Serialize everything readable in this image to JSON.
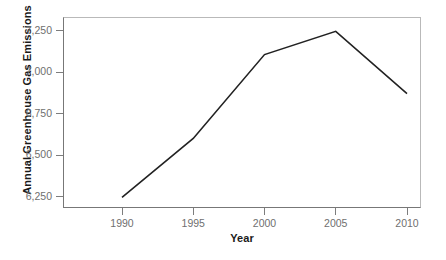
{
  "chart_data": {
    "type": "line",
    "title": "",
    "xlabel": "Year",
    "ylabel": "Annual Greenhouse Gas Emissions",
    "x": [
      1990,
      1995,
      2000,
      2005,
      2010
    ],
    "values": [
      6245,
      6600,
      7105,
      7245,
      6870
    ],
    "series": [
      {
        "name": "Annual Greenhouse Gas Emissions",
        "values": [
          6245,
          6600,
          7105,
          7245,
          6870
        ],
        "color": "#222222"
      }
    ],
    "x_tick_labels": [
      "1990",
      "1995",
      "2000",
      "2005",
      "2010"
    ],
    "y_tick_labels": [
      "6,250",
      "6,500",
      "6,750",
      "7,000",
      "7,250"
    ],
    "y_tick_values": [
      6250,
      6500,
      6750,
      7000,
      7250
    ],
    "xlim": [
      1986.5,
      1011.5
    ],
    "ylim": [
      6120,
      7345
    ],
    "grid": false,
    "legend": false,
    "legend_position": "none",
    "line_color": "#222222",
    "axis_color": "#777777",
    "tick_label_color": "#6f6f6f",
    "background_color": "#ffffff"
  },
  "axes": {
    "y_title": "Annual Greenhouse Gas Emissions",
    "x_title": "Year",
    "y_ticks": [
      {
        "label": "7,250",
        "value": 7250
      },
      {
        "label": "7,000",
        "value": 7000
      },
      {
        "label": "6,750",
        "value": 6750
      },
      {
        "label": "6,500",
        "value": 6500
      },
      {
        "label": "6,250",
        "value": 6250
      }
    ],
    "x_ticks": [
      {
        "label": "1990",
        "value": 1990
      },
      {
        "label": "1995",
        "value": 1995
      },
      {
        "label": "2000",
        "value": 2000
      },
      {
        "label": "2005",
        "value": 2005
      },
      {
        "label": "2010",
        "value": 2010
      }
    ]
  }
}
